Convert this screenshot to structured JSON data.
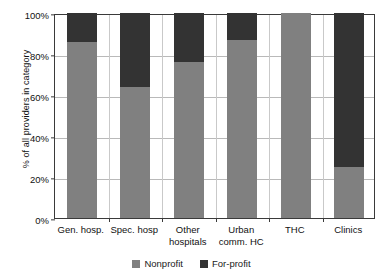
{
  "chart_data": {
    "type": "bar",
    "stacked": true,
    "title": "",
    "xlabel": "",
    "ylabel": "% of all providers in category",
    "ylim": [
      0,
      100
    ],
    "yticks": [
      0,
      20,
      40,
      60,
      80,
      100
    ],
    "ytick_labels": [
      "0%",
      "20%",
      "40%",
      "60%",
      "80%",
      "100%"
    ],
    "grid": true,
    "grid_axis": "both",
    "legend_position": "bottom",
    "categories": [
      "Gen. hosp.",
      "Spec. hosp",
      "Other\nhospitals",
      "Urban\ncomm. HC",
      "THC",
      "Clinics"
    ],
    "series": [
      {
        "name": "Nonprofit",
        "color": "#808080",
        "values": [
          86,
          64,
          76,
          87,
          100,
          25
        ]
      },
      {
        "name": "For-profit",
        "color": "#333333",
        "values": [
          14,
          36,
          24,
          13,
          0,
          75
        ]
      }
    ]
  },
  "legend": {
    "items": [
      {
        "label": "Nonprofit",
        "swatch": "nonprofit-swatch"
      },
      {
        "label": "For-profit",
        "swatch": "forprofit-swatch"
      }
    ]
  }
}
